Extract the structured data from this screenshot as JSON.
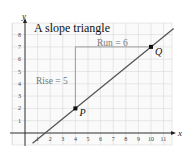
{
  "chart_data": {
    "type": "line",
    "title": "A slope triangle",
    "xlabel": "x",
    "ylabel": "y",
    "xlim": [
      -1.0,
      11.8
    ],
    "ylim": [
      -1.0,
      8.6
    ],
    "grid": true,
    "x_ticks": [
      "1",
      "2",
      "3",
      "4",
      "5",
      "6",
      "7",
      "8",
      "9",
      "10",
      "11"
    ],
    "y_ticks": [
      "1",
      "2",
      "3",
      "4",
      "5",
      "6",
      "7",
      "8"
    ],
    "line": {
      "slope": 0.8333,
      "through": [
        [
          4,
          2
        ],
        [
          10,
          7
        ]
      ],
      "x_range": [
        0.6,
        11.8
      ]
    },
    "points": [
      {
        "label": "P",
        "x": 4,
        "y": 2
      },
      {
        "label": "Q",
        "x": 10,
        "y": 7
      }
    ],
    "triangle": {
      "rise": {
        "label": "Rise = 5",
        "from": [
          4,
          2
        ],
        "to": [
          4,
          7
        ]
      },
      "run": {
        "label": "Run = 6",
        "from": [
          4,
          7
        ],
        "to": [
          10,
          7
        ]
      }
    },
    "colors": {
      "line": "#555555",
      "grid": "#d9d9d9",
      "axis": "#222222",
      "triangle": "#888888"
    }
  }
}
